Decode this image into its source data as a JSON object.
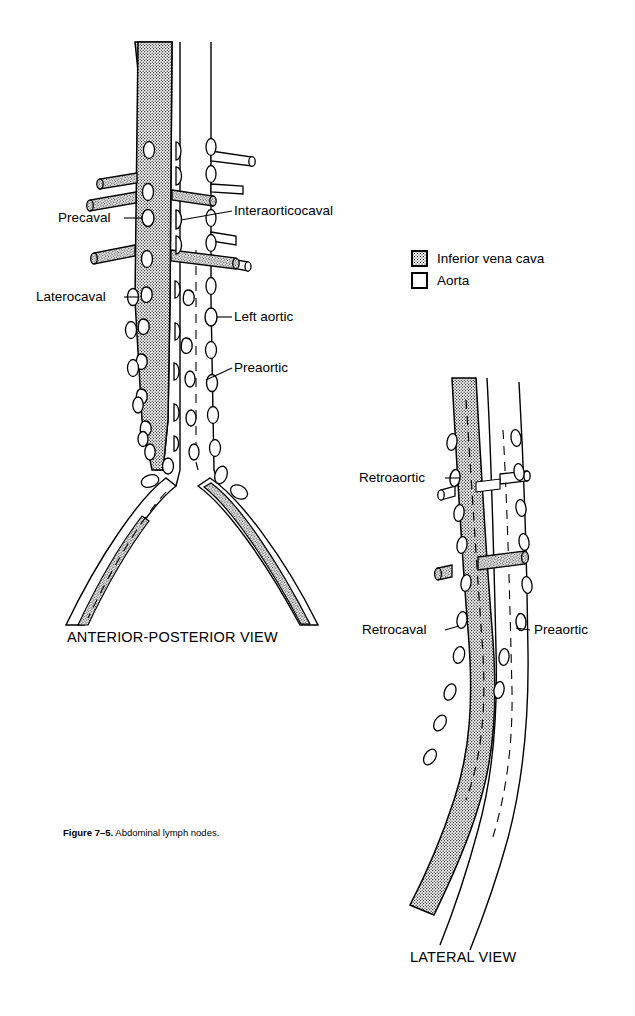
{
  "figure": {
    "caption_bold": "Figure 7–5.",
    "caption_rest": "Abdominal lymph nodes."
  },
  "legend": {
    "items": [
      {
        "swatch": "stipple-square",
        "label": "Inferior vena cava"
      },
      {
        "swatch": "white-square",
        "label": "Aorta"
      }
    ]
  },
  "views": {
    "anterior_posterior": {
      "title": "ANTERIOR-POSTERIOR VIEW",
      "labels": [
        {
          "text": "Precaval"
        },
        {
          "text": "Interaorticocaval"
        },
        {
          "text": "Laterocaval"
        },
        {
          "text": "Left aortic"
        },
        {
          "text": "Preaortic"
        }
      ]
    },
    "lateral": {
      "title": "LATERAL VIEW",
      "labels": [
        {
          "text": "Retroaortic"
        },
        {
          "text": "Retrocaval"
        },
        {
          "text": "Preaortic"
        }
      ]
    }
  },
  "colors": {
    "ink": "#000000",
    "paper": "#ffffff",
    "stipple": "#000000"
  }
}
